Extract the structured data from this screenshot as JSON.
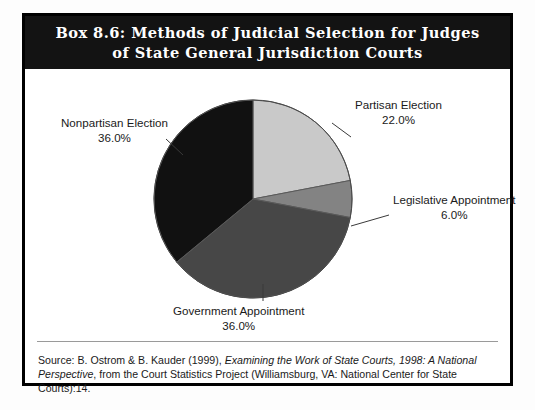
{
  "box": {
    "title_line1": "Box 8.6: Methods of Judicial Selection for Judges",
    "title_line2": "of State General Jurisdiction Courts"
  },
  "source": {
    "prefix": "Source: B. Ostrom & B. Kauder (1999), ",
    "italic": "Examining the Work of State Courts, 1998: A National Perspective",
    "suffix": ", from the Court Statistics Project (Williamsburg, VA: National Center for State Courts):14."
  },
  "labels": {
    "nonpartisan": {
      "name": "Nonpartisan Election",
      "pct": "36.0%"
    },
    "partisan": {
      "name": "Partisan Election",
      "pct": "22.0%"
    },
    "legislative": {
      "name": "Legislative Appointment",
      "pct": "6.0%"
    },
    "government": {
      "name": "Government Appointment",
      "pct": "36.0%"
    }
  },
  "chart_data": {
    "type": "pie",
    "title": "Box 8.6: Methods of Judicial Selection for Judges of State General Jurisdiction Courts",
    "categories": [
      "Partisan Election",
      "Legislative Appointment",
      "Government Appointment",
      "Nonpartisan Election"
    ],
    "values": [
      22.0,
      6.0,
      36.0,
      36.0
    ],
    "unit": "percent",
    "colors": [
      "#c9c9c9",
      "#838383",
      "#474747",
      "#111111"
    ],
    "start_angle_deg": 0,
    "direction": "clockwise",
    "legend": "none",
    "labels_position": "outside-with-leader-lines",
    "data_labels": [
      "22.0%",
      "6.0%",
      "36.0%",
      "36.0%"
    ]
  }
}
